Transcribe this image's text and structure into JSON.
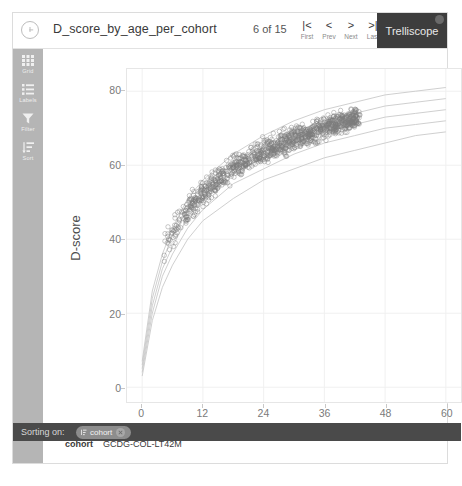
{
  "header": {
    "info_icon": "info-icon",
    "title": "D_score_by_age_per_cohort",
    "counter": "6 of 15",
    "nav": [
      {
        "glyph": "|<",
        "label": "First",
        "name": "first"
      },
      {
        "glyph": "<",
        "label": "Prev",
        "name": "prev"
      },
      {
        "glyph": ">",
        "label": "Next",
        "name": "next"
      },
      {
        "glyph": ">|",
        "label": "Last",
        "name": "last"
      }
    ],
    "brand": "Trelliscope",
    "help_icon": "help-icon"
  },
  "sidebar": {
    "items": [
      {
        "label": "Grid",
        "icon": "grid-icon"
      },
      {
        "label": "Labels",
        "icon": "labels-icon"
      },
      {
        "label": "Filter",
        "icon": "filter-icon"
      },
      {
        "label": "Sort",
        "icon": "sort-icon"
      }
    ]
  },
  "meta": {
    "key": "cohort",
    "value": "GCDG-COL-LT42M"
  },
  "sorting": {
    "lead": "Sorting on:",
    "chip_label": "cohort",
    "chip_icon": "sort-asc-icon",
    "remove_icon": "close-icon"
  },
  "colors": {
    "brand_bar": "#3d3d3d",
    "sidebar": "#b5b5b5",
    "sort_bar": "#4a4a4a",
    "point": "#7d7d7d",
    "curve": "#c9c9c9",
    "grid": "#f0f0f0"
  },
  "chart_data": {
    "type": "scatter",
    "title": "",
    "xlabel": "Age (in months)",
    "ylabel": "D-score",
    "xlim": [
      -3,
      63
    ],
    "ylim": [
      -4,
      86
    ],
    "xticks": [
      0,
      12,
      24,
      36,
      48,
      60
    ],
    "yticks": [
      0,
      20,
      40,
      60,
      80
    ],
    "grid": true,
    "legend": "none",
    "point_style": {
      "marker": "open-circle",
      "size": 2.2,
      "color": "#7d7d7d",
      "opacity": 0.55
    },
    "n_points_approx": 1100,
    "x_data_range": [
      4,
      43
    ],
    "y_data_range": [
      33,
      76
    ],
    "scatter_band": {
      "description": "Dense band of child D-score observations rising with age, concave down",
      "center_curve": [
        {
          "x": 4,
          "y": 37
        },
        {
          "x": 6,
          "y": 42
        },
        {
          "x": 8,
          "y": 46
        },
        {
          "x": 10,
          "y": 49.5
        },
        {
          "x": 12,
          "y": 52.5
        },
        {
          "x": 15,
          "y": 56
        },
        {
          "x": 18,
          "y": 59
        },
        {
          "x": 21,
          "y": 61.5
        },
        {
          "x": 24,
          "y": 63.5
        },
        {
          "x": 27,
          "y": 65.5
        },
        {
          "x": 30,
          "y": 67
        },
        {
          "x": 33,
          "y": 68.5
        },
        {
          "x": 36,
          "y": 70
        },
        {
          "x": 39,
          "y": 71.5
        },
        {
          "x": 42,
          "y": 72.5
        }
      ],
      "half_width": [
        5.5,
        5.0,
        4.6,
        4.3,
        4.1,
        3.9,
        3.8,
        3.7,
        3.6,
        3.5,
        3.5,
        3.4,
        3.4,
        3.3,
        3.2
      ]
    },
    "reference_curves": {
      "count": 5,
      "names": [
        "-2 SD",
        "-1 SD",
        "median",
        "+1 SD",
        "+2 SD"
      ],
      "color": "#c9c9c9",
      "x": [
        0,
        2,
        4,
        6,
        9,
        12,
        18,
        24,
        30,
        36,
        42,
        48,
        54,
        60
      ],
      "series": [
        {
          "name": "-2 SD",
          "values": [
            3,
            18,
            27,
            33,
            40,
            45,
            51,
            56,
            59,
            62,
            64,
            66,
            68,
            69
          ]
        },
        {
          "name": "-1 SD",
          "values": [
            4,
            20,
            30,
            36,
            43,
            48,
            55,
            59,
            63,
            66,
            68,
            70,
            71,
            72
          ]
        },
        {
          "name": "median",
          "values": [
            5,
            22,
            32,
            38,
            46,
            51,
            58,
            62,
            66,
            69,
            71,
            73,
            74,
            75
          ]
        },
        {
          "name": "+1 SD",
          "values": [
            6,
            24,
            34,
            41,
            48,
            53,
            60,
            65,
            69,
            72,
            74,
            76,
            77,
            78
          ]
        },
        {
          "name": "+2 SD",
          "values": [
            7,
            26,
            36,
            43,
            51,
            56,
            63,
            68,
            72,
            75,
            77,
            79,
            80,
            81
          ]
        }
      ]
    }
  }
}
